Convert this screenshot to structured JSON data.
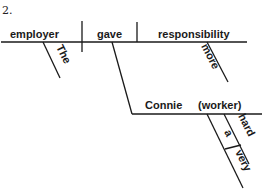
{
  "problem_number": "2.",
  "diagram": {
    "type": "sentence-diagram",
    "main_clause": {
      "subject": "employer",
      "verb": "gave",
      "direct_object": "responsibility"
    },
    "modifiers": {
      "subject_modifier": "The",
      "object_modifier": "more"
    },
    "indirect_object_phrase": {
      "noun": "Connie",
      "appositive": "(worker)",
      "modifiers": [
        "a",
        "hard"
      ],
      "adverb_of_hard": "very"
    }
  },
  "colors": {
    "ink": "#1a1a1a",
    "background": "#ffffff"
  }
}
